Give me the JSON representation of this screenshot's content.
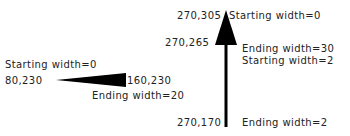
{
  "horizontal_polyline": {
    "start_coord": "80,230",
    "end_coord": "160,230",
    "start_label": "Starting width=0",
    "end_label": "Ending width=20"
  },
  "vertical_polyline": {
    "top_coord": "270,305",
    "mid_coord": "270,265",
    "bottom_coord": "270,170",
    "top_label": "Starting width=0",
    "mid_end_label": "Ending width=30",
    "mid_start_label": "Starting width=2",
    "bottom_label": "Ending width=2"
  },
  "colors": {
    "shape_fill": "#000000",
    "text": "#222222",
    "background": "#ffffff"
  }
}
